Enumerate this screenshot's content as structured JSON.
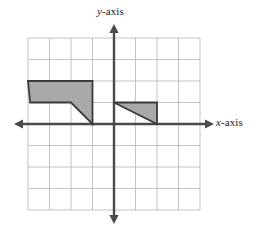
{
  "figure": {
    "type": "coordinate-plane",
    "title": "",
    "background_color": "#ffffff"
  },
  "axes": {
    "x_label": "x-axis",
    "x_label_var": "x",
    "x_label_suffix": "-axis",
    "y_label": "y-axis",
    "y_label_var": "y",
    "y_label_suffix": "-axis",
    "axis_color": "#4a4a4a",
    "axis_line_width": 2.4,
    "arrowheads": [
      "left",
      "right",
      "up",
      "down"
    ],
    "tick_labels": [],
    "origin_label": ""
  },
  "grid": {
    "columns": 8,
    "rows": 8,
    "cell_size_px": 21.5,
    "x_min": -4,
    "x_max": 4,
    "y_min": -4,
    "y_max": 4,
    "line_color": "#b4b4b4",
    "line_width": 0.8,
    "border_color": "#b4b4b4",
    "visible": true
  },
  "shapes": [
    {
      "name": "left-figure",
      "label": "",
      "kind": "polygon",
      "fill": "#a9a9a9",
      "stroke": "#3a3a3a",
      "stroke_width": 1.8,
      "vertices": [
        {
          "x": -4,
          "y": 2
        },
        {
          "x": -1,
          "y": 2
        },
        {
          "x": -1,
          "y": 0
        },
        {
          "x": -2,
          "y": 1
        },
        {
          "x": -3.9,
          "y": 1
        }
      ]
    },
    {
      "name": "right-figure",
      "label": "",
      "kind": "polygon",
      "fill": "#a9a9a9",
      "stroke": "#3a3a3a",
      "stroke_width": 1.8,
      "vertices": [
        {
          "x": 0,
          "y": 1
        },
        {
          "x": 2,
          "y": 1
        },
        {
          "x": 2,
          "y": 0
        }
      ]
    }
  ],
  "chart_data": {
    "type": "scatter",
    "title": "",
    "xlabel": "x-axis",
    "ylabel": "y-axis",
    "xlim": [
      -4,
      4
    ],
    "ylim": [
      -4,
      4
    ],
    "grid": true,
    "legend": "none",
    "annotations": [],
    "series": [
      {
        "name": "left-figure",
        "kind": "polygon",
        "fill": "#a9a9a9",
        "x": [
          -4,
          -1,
          -1,
          -2,
          -3.9
        ],
        "y": [
          2,
          2,
          0,
          1,
          1
        ]
      },
      {
        "name": "right-figure",
        "kind": "polygon",
        "fill": "#a9a9a9",
        "x": [
          0,
          2,
          2
        ],
        "y": [
          1,
          1,
          0
        ]
      }
    ]
  }
}
